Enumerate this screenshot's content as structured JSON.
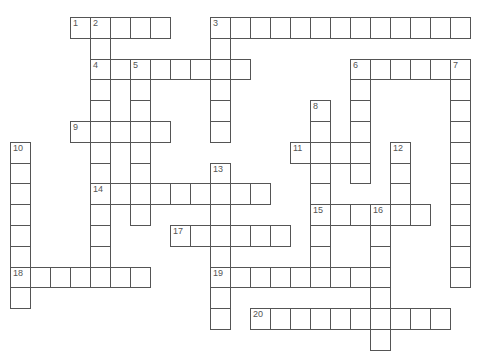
{
  "puzzle": {
    "type": "crossword",
    "grid": {
      "cols": 23,
      "rows": 16,
      "origin_x": 10,
      "origin_y": 17,
      "cell_w": 20,
      "cell_h": 20.8
    },
    "colors": {
      "border": "#555555",
      "cell_bg": "#ffffff",
      "number": "#555555"
    },
    "across": [
      {
        "number": "1",
        "row": 0,
        "col": 3,
        "length": 5
      },
      {
        "number": "3",
        "row": 0,
        "col": 10,
        "length": 13
      },
      {
        "number": "4",
        "row": 2,
        "col": 4,
        "length": 8
      },
      {
        "number": "6",
        "row": 2,
        "col": 17,
        "length": 6
      },
      {
        "number": "9",
        "row": 5,
        "col": 3,
        "length": 5
      },
      {
        "number": "11",
        "row": 6,
        "col": 14,
        "length": 4
      },
      {
        "number": "14",
        "row": 8,
        "col": 4,
        "length": 9
      },
      {
        "number": "15",
        "row": 9,
        "col": 15,
        "length": 6
      },
      {
        "number": "17",
        "row": 10,
        "col": 8,
        "length": 6
      },
      {
        "number": "18",
        "row": 12,
        "col": 0,
        "length": 7
      },
      {
        "number": "19",
        "row": 12,
        "col": 10,
        "length": 9
      },
      {
        "number": "20",
        "row": 14,
        "col": 12,
        "length": 10
      }
    ],
    "down": [
      {
        "number": "2",
        "row": 0,
        "col": 4,
        "length": 13
      },
      {
        "number": "3",
        "row": 0,
        "col": 10,
        "length": 6
      },
      {
        "number": "5",
        "row": 2,
        "col": 6,
        "length": 8
      },
      {
        "number": "6",
        "row": 2,
        "col": 17,
        "length": 6
      },
      {
        "number": "7",
        "row": 2,
        "col": 22,
        "length": 11
      },
      {
        "number": "8",
        "row": 4,
        "col": 15,
        "length": 9
      },
      {
        "number": "10",
        "row": 6,
        "col": 0,
        "length": 8
      },
      {
        "number": "12",
        "row": 6,
        "col": 19,
        "length": 4
      },
      {
        "number": "13",
        "row": 7,
        "col": 10,
        "length": 8
      },
      {
        "number": "16",
        "row": 9,
        "col": 18,
        "length": 7
      }
    ]
  }
}
